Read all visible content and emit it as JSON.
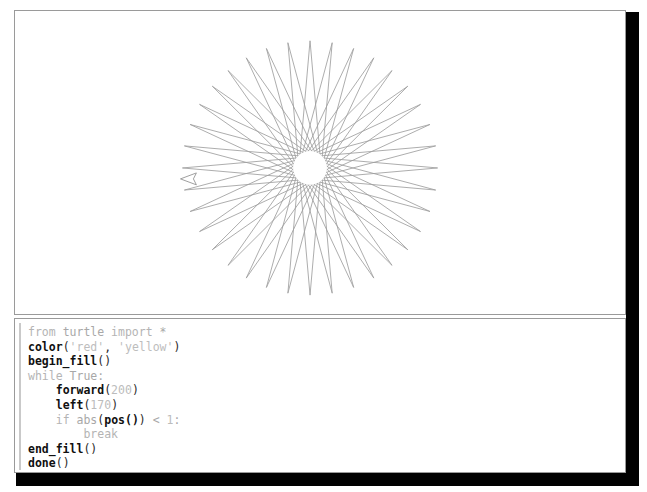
{
  "window": {
    "name": "python-turtle-graphics",
    "background_color": "#ffffff",
    "border_color": "#9a9a9a",
    "shadow_color": "#010101"
  },
  "turtle_canvas": {
    "name": "turtle-drawing-canvas",
    "description": "36-point star polygon drawn by turtle graphics",
    "line_color": "#9e9e9e",
    "fill_color": "#ffffff",
    "center_x": 311,
    "center_y": 169,
    "outer_radius": 128,
    "inner_hole_radius": 17,
    "points": 36,
    "turn_angle": 170,
    "step_length": 200,
    "turtle_cursor": {
      "name": "turtle-cursor",
      "shape": "classic-arrow",
      "x": 189,
      "y": 180,
      "heading_degrees": 180,
      "color": "#9e9e9e"
    }
  },
  "code_panel": {
    "name": "source-code-panel",
    "language": "python",
    "lines": [
      "from turtle import *",
      "color('red', 'yellow')",
      "begin_fill()",
      "while True:",
      "    forward(200)",
      "    left(170)",
      "    if abs(pos()) < 1:",
      "        break",
      "end_fill()",
      "done()"
    ],
    "tokens": {
      "line1": {
        "kw_from": "from",
        "module": " turtle ",
        "kw_import": "import",
        "star": " *"
      },
      "line2": {
        "fn": "color",
        "open": "(",
        "str1": "'red'",
        "comma": ", ",
        "str2": "'yellow'",
        "close": ")"
      },
      "line3": {
        "fn": "begin_fill",
        "parens": "()"
      },
      "line4": {
        "kw": "while",
        "cond": " True:"
      },
      "line5": {
        "indent": "    ",
        "fn": "forward",
        "open": "(",
        "num": "200",
        "close": ")"
      },
      "line6": {
        "indent": "    ",
        "fn": "left",
        "open": "(",
        "num": "170",
        "close": ")"
      },
      "line7": {
        "indent": "    ",
        "kw": "if",
        "abs": " abs",
        "open": "(",
        "fn": "pos()",
        "close": ")",
        "cmp": " < ",
        "num": "1",
        "colon": ":"
      },
      "line8": {
        "indent": "        ",
        "kw": "break"
      },
      "line9": {
        "fn": "end_fill",
        "parens": "()"
      },
      "line10": {
        "fn": "done",
        "parens": "()"
      }
    }
  }
}
